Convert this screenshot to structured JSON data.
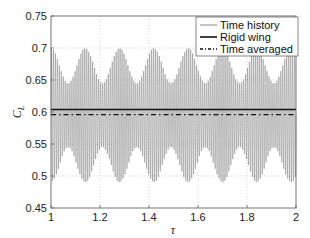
{
  "chart_data": {
    "type": "line",
    "title": "",
    "xlabel": "τ",
    "ylabel": "C_L",
    "ylabel_main": "C",
    "ylabel_sub": "L",
    "xlim": [
      1,
      2
    ],
    "ylim": [
      0.45,
      0.75
    ],
    "grid": true,
    "legend_position": "upper right",
    "x_ticks": [
      1,
      1.2,
      1.4,
      1.6,
      1.8,
      2
    ],
    "x_tick_labels": [
      "1",
      "1.2",
      "1.4",
      "1.6",
      "1.8",
      "2"
    ],
    "y_ticks": [
      0.45,
      0.5,
      0.55,
      0.6,
      0.65,
      0.7,
      0.75
    ],
    "y_tick_labels": [
      "0.45",
      "0.5",
      "0.55",
      "0.6",
      "0.65",
      "0.7",
      "0.75"
    ],
    "series": [
      {
        "name": "Time history",
        "style": "thin solid gray",
        "color": "#8a8a8a",
        "description": "Dense high-frequency oscillation with beating envelope; peaks ~0.68-0.70, troughs ~0.49-0.52",
        "mean": 0.596,
        "carrier_period": 0.008,
        "beat_period": 0.14,
        "max_envelope": [
          0.645,
          0.7
        ],
        "min_envelope": [
          0.49,
          0.545
        ]
      },
      {
        "name": "Rigid wing",
        "style": "thick solid black",
        "color": "#111111",
        "constant_value": 0.604
      },
      {
        "name": "Time averaged",
        "style": "dash-dot black",
        "color": "#111111",
        "constant_value": 0.596
      }
    ]
  },
  "legend": {
    "items": [
      {
        "label": "Time history"
      },
      {
        "label": "Rigid wing"
      },
      {
        "label": "Time averaged"
      }
    ]
  }
}
